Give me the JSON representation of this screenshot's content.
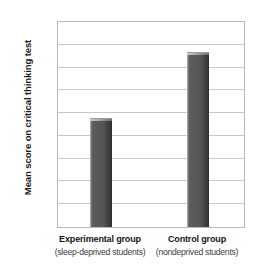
{
  "chart_data": {
    "type": "bar",
    "title": "",
    "xlabel": "",
    "ylabel": "Mean score on critical thinking test",
    "ylim": [
      0,
      45
    ],
    "ytick_step": 5,
    "yticks": [
      "0",
      "5",
      "10",
      "15",
      "20",
      "25",
      "30",
      "35",
      "40",
      "45"
    ],
    "grid": true,
    "legend": "none",
    "categories": [
      "Experimental group",
      "Control group"
    ],
    "category_sublabels": [
      "(sleep-deprived students)",
      "(nondeprived students)"
    ],
    "values": [
      24,
      38.5
    ],
    "bar_color": "#555555",
    "gridline_color": "#c9c9c9",
    "frame_color": "#b9b9b9",
    "background_color": "#ffffff"
  }
}
